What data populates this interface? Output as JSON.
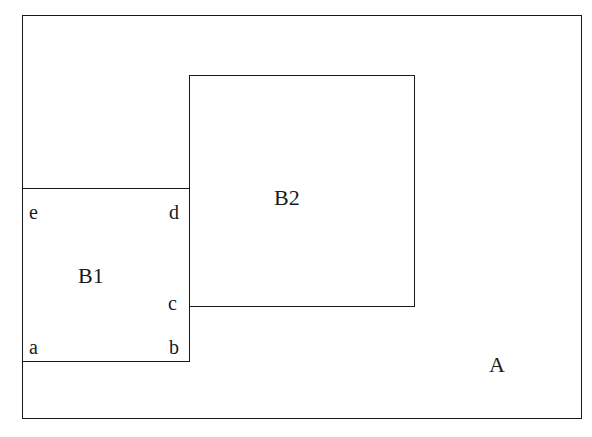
{
  "diagram": {
    "regions": {
      "A": {
        "label": "A"
      },
      "B1": {
        "label": "B1"
      },
      "B2": {
        "label": "B2"
      }
    },
    "corners": {
      "a": "a",
      "b": "b",
      "c": "c",
      "d": "d",
      "e": "e"
    },
    "colors": {
      "stroke": "#1a1a1a",
      "background": "#ffffff"
    }
  }
}
